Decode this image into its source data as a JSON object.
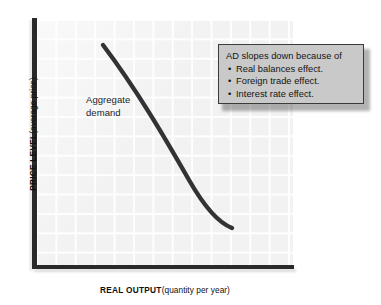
{
  "chart_data": {
    "type": "line",
    "title": "",
    "xlabel_strong": "REAL OUTPUT",
    "xlabel_light": "(quantity per year)",
    "ylabel_strong": "PRICE LEVEL",
    "ylabel_light": "(average price)",
    "grid": true,
    "legend_position": "none",
    "xlim": [
      0,
      100
    ],
    "ylim": [
      0,
      100
    ],
    "series": [
      {
        "name": "Aggregate demand",
        "label_line1": "Aggregate",
        "label_line2": "demand",
        "color": "#333333",
        "x": [
          26,
          34,
          42,
          50,
          58,
          66,
          73,
          76
        ],
        "y": [
          90,
          82,
          73,
          63,
          52,
          39,
          24,
          15
        ]
      }
    ],
    "annotations": [
      {
        "name": "ad-slope-callout",
        "heading": "AD slopes down because of",
        "items": [
          "Real balances effect.",
          "Foreign trade effect.",
          "Interest rate effect."
        ]
      }
    ],
    "colors": {
      "plot_background": "#f2f2f2",
      "grid_line": "#ffffff",
      "axis": "#2a2a2a",
      "curve": "#333333",
      "callout_fill": "#c9c9c9",
      "callout_border": "#3b3b3b",
      "text": "#141414"
    }
  },
  "curve_geometry": {
    "path": "M 66,25 C 100,70 128,118 152,160 C 168,188 182,203 195,208"
  }
}
